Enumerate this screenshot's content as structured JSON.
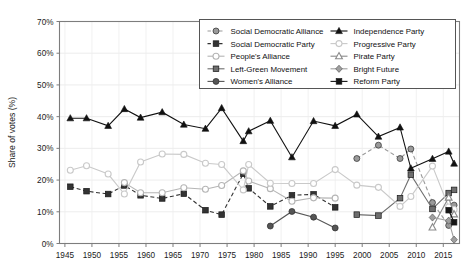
{
  "chart_data": {
    "type": "line",
    "title": "",
    "xlabel": "",
    "ylabel": "Share of votes (%)",
    "xlim": [
      1944,
      2018
    ],
    "ylim": [
      0,
      70
    ],
    "ytick_labels": [
      "0%",
      "10%",
      "20%",
      "30%",
      "40%",
      "50%",
      "60%",
      "70%"
    ],
    "ytick_values": [
      0,
      10,
      20,
      30,
      40,
      50,
      60,
      70
    ],
    "xtick_labels": [
      "1945",
      "1950",
      "1955",
      "1960",
      "1965",
      "1970",
      "1975",
      "1980",
      "1985",
      "1990",
      "1995",
      "2000",
      "2005",
      "2010",
      "2015"
    ],
    "xtick_values": [
      1945,
      1950,
      1955,
      1960,
      1965,
      1970,
      1975,
      1980,
      1985,
      1990,
      1995,
      2000,
      2005,
      2010,
      2015
    ],
    "grid": "y-major-light",
    "legend_position": "top-right",
    "series": [
      {
        "name": "Social Democratic Alliance",
        "color": "#9a9a9a",
        "marker": "circle-filled",
        "dash": "dashed",
        "points": [
          [
            1999,
            26.8
          ],
          [
            2003,
            31.0
          ],
          [
            2007,
            26.8
          ],
          [
            2009,
            29.8
          ],
          [
            2013,
            12.9
          ],
          [
            2016,
            5.7
          ],
          [
            2017,
            12.1
          ]
        ]
      },
      {
        "name": "Social Democratic Party",
        "color": "#333333",
        "marker": "square-filled",
        "dash": "dashed",
        "points": [
          [
            1946,
            17.9
          ],
          [
            1949,
            16.5
          ],
          [
            1953,
            15.6
          ],
          [
            1956,
            18.3
          ],
          [
            1959,
            15.2
          ],
          [
            1963,
            14.2
          ],
          [
            1967,
            15.7
          ],
          [
            1971,
            10.5
          ],
          [
            1974,
            9.1
          ],
          [
            1978,
            22.0
          ],
          [
            1979,
            17.4
          ],
          [
            1983,
            11.7
          ],
          [
            1987,
            15.2
          ],
          [
            1991,
            15.5
          ],
          [
            1995,
            11.4
          ]
        ]
      },
      {
        "name": "People's Alliance",
        "color": "#b5b5b5",
        "marker": "circle-open",
        "dash": "solid",
        "points": [
          [
            1956,
            19.2
          ],
          [
            1959,
            16.0
          ],
          [
            1963,
            16.0
          ],
          [
            1967,
            17.6
          ],
          [
            1971,
            17.1
          ],
          [
            1974,
            18.3
          ],
          [
            1978,
            22.9
          ],
          [
            1979,
            19.7
          ],
          [
            1983,
            17.3
          ],
          [
            1987,
            13.3
          ],
          [
            1991,
            14.4
          ],
          [
            1995,
            14.3
          ]
        ]
      },
      {
        "name": "Left-Green Movement",
        "color": "#6e6e6e",
        "marker": "square-filled",
        "dash": "solid",
        "points": [
          [
            1999,
            9.1
          ],
          [
            2003,
            8.8
          ],
          [
            2007,
            14.3
          ],
          [
            2009,
            21.7
          ],
          [
            2013,
            10.9
          ],
          [
            2016,
            15.9
          ],
          [
            2017,
            16.9
          ]
        ]
      },
      {
        "name": "Women's Alliance",
        "color": "#555555",
        "marker": "circle-filled",
        "dash": "solid",
        "points": [
          [
            1983,
            5.5
          ],
          [
            1987,
            10.1
          ],
          [
            1991,
            8.3
          ],
          [
            1995,
            4.9
          ]
        ]
      },
      {
        "name": "Independence Party",
        "color": "#111111",
        "marker": "triangle-filled",
        "dash": "solid",
        "points": [
          [
            1946,
            39.5
          ],
          [
            1949,
            39.5
          ],
          [
            1953,
            37.1
          ],
          [
            1956,
            42.4
          ],
          [
            1959,
            39.7
          ],
          [
            1963,
            41.4
          ],
          [
            1967,
            37.5
          ],
          [
            1971,
            36.2
          ],
          [
            1974,
            42.7
          ],
          [
            1978,
            32.3
          ],
          [
            1979,
            35.4
          ],
          [
            1983,
            38.7
          ],
          [
            1987,
            27.2
          ],
          [
            1991,
            38.6
          ],
          [
            1995,
            37.1
          ],
          [
            1999,
            40.7
          ],
          [
            2003,
            33.7
          ],
          [
            2007,
            36.6
          ],
          [
            2009,
            23.7
          ],
          [
            2013,
            26.7
          ],
          [
            2016,
            29.0
          ],
          [
            2017,
            25.2
          ]
        ]
      },
      {
        "name": "Progressive Party",
        "color": "#c9c9c9",
        "marker": "circle-open",
        "dash": "solid",
        "points": [
          [
            1946,
            23.1
          ],
          [
            1949,
            24.5
          ],
          [
            1953,
            21.9
          ],
          [
            1956,
            15.6
          ],
          [
            1959,
            25.7
          ],
          [
            1963,
            28.2
          ],
          [
            1967,
            28.1
          ],
          [
            1971,
            25.3
          ],
          [
            1974,
            24.9
          ],
          [
            1978,
            16.9
          ],
          [
            1979,
            24.9
          ],
          [
            1983,
            19.0
          ],
          [
            1987,
            18.9
          ],
          [
            1991,
            18.9
          ],
          [
            1995,
            23.3
          ],
          [
            1999,
            18.4
          ],
          [
            2003,
            17.7
          ],
          [
            2007,
            11.7
          ],
          [
            2009,
            14.8
          ],
          [
            2013,
            24.4
          ],
          [
            2016,
            11.5
          ],
          [
            2017,
            10.7
          ]
        ]
      },
      {
        "name": "Pirate Party",
        "color": "#8a8a8a",
        "marker": "triangle-open",
        "dash": "solid",
        "points": [
          [
            2013,
            5.1
          ],
          [
            2016,
            14.5
          ],
          [
            2017,
            9.2
          ]
        ]
      },
      {
        "name": "Bright Future",
        "color": "#9f9f9f",
        "marker": "diamond-filled",
        "dash": "solid",
        "points": [
          [
            2013,
            8.2
          ],
          [
            2016,
            7.2
          ],
          [
            2017,
            1.2
          ]
        ]
      },
      {
        "name": "Reform Party",
        "color": "#151515",
        "marker": "square-filled",
        "dash": "solid",
        "points": [
          [
            2016,
            10.5
          ],
          [
            2017,
            6.7
          ]
        ]
      }
    ]
  },
  "legend": {
    "columns": [
      [
        "Social Democratic Alliance",
        "Social Democratic Party",
        "People's Alliance",
        "Left-Green Movement",
        "Women's Alliance"
      ],
      [
        "Independence Party",
        "Progressive Party",
        "Pirate Party",
        "Bright Future",
        "Reform Party"
      ]
    ]
  }
}
